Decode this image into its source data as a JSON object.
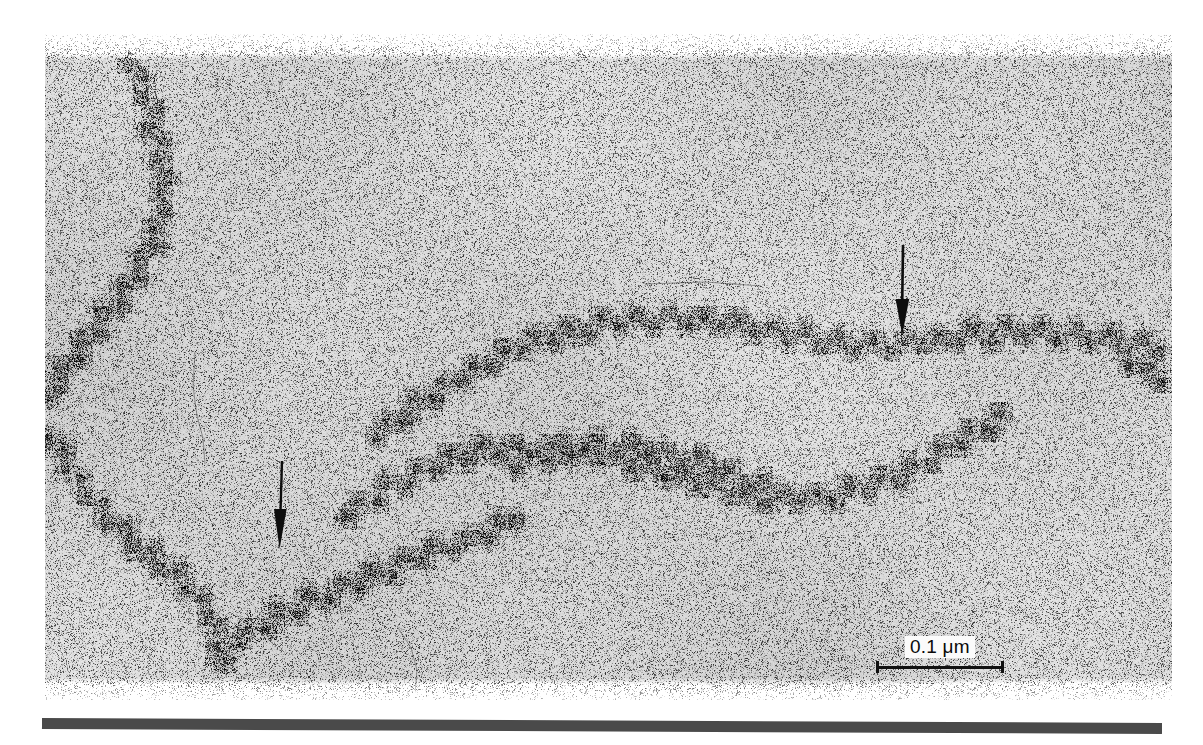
{
  "figure": {
    "kind": "electron-micrograph",
    "background_color": "#ffffff",
    "plate": {
      "grain_base_color": "#d9d9d9",
      "grain_dark_color": "#141414",
      "left": 45,
      "top": 34,
      "width": 1127,
      "height": 666
    }
  },
  "annotations": {
    "arrows": [
      {
        "name": "arrow-right-marker",
        "direction": "down",
        "color": "#0d0d0d",
        "x": 888,
        "y": 243,
        "length": 92
      },
      {
        "name": "arrow-left-marker",
        "direction": "down",
        "color": "#0d0d0d",
        "x": 266,
        "y": 459,
        "length": 90
      }
    ]
  },
  "scale_bar": {
    "value": "0.1",
    "unit": "μm",
    "label": "0.1 μm",
    "length_px": 128,
    "color": "#111111",
    "label_background": "#fbfbfb"
  },
  "rule": {
    "name": "bottom-rule",
    "color": "#4a4a4a",
    "width": 1120,
    "height": 11
  }
}
